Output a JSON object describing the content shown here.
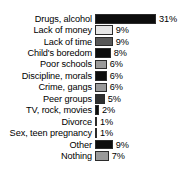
{
  "chart_data": {
    "type": "bar",
    "orientation": "horizontal",
    "title": "",
    "subtitle": "",
    "xlabel": "",
    "ylabel": "",
    "grid": false,
    "legend": false,
    "value_suffix": "%",
    "xlim": [
      0,
      31
    ],
    "px_per_unit": 1.97,
    "categories": [
      "Drugs, alcohol",
      "Lack of money",
      "Lack of time",
      "Child's boredom",
      "Poor schools",
      "Discipline, morals",
      "Crime, gangs",
      "Peer groups",
      "TV, rock, movies",
      "Divorce",
      "Sex, teen pregnancy",
      "Other",
      "Nothing"
    ],
    "values": [
      31,
      9,
      9,
      8,
      6,
      6,
      6,
      5,
      2,
      1,
      1,
      9,
      7
    ],
    "value_labels": [
      "31%",
      "9%",
      "9%",
      "8%",
      "6%",
      "6%",
      "6%",
      "5%",
      "2%",
      "1%",
      "1%",
      "9%",
      "7%"
    ],
    "bar_colors": [
      "#0d0d0d",
      "#e6e6e6",
      "#585858",
      "#0d0d0d",
      "#9a9a9a",
      "#0d0d0d",
      "#9a9a9a",
      "#2e2e2e",
      "#0d0d0d",
      "#b5b5b5",
      "#c9c9c9",
      "#0d0d0d",
      "#9a9a9a"
    ],
    "bar_outline_color": "#2b2b2b",
    "background_color": "#ffffff",
    "text_color": "#000000"
  }
}
